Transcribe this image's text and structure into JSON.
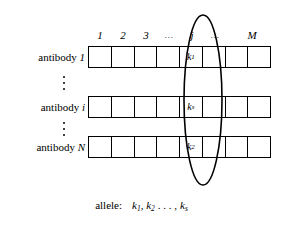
{
  "figure": {
    "name": "antibody-allele-matrix-diagram",
    "background_color": "#ffffff",
    "line_color": "#000000"
  },
  "columns": {
    "headers": [
      {
        "label": "1",
        "kind": "index"
      },
      {
        "label": "2",
        "kind": "index"
      },
      {
        "label": "3",
        "kind": "index"
      },
      {
        "label": "…",
        "kind": "ellipsis"
      },
      {
        "label": "j",
        "kind": "index"
      },
      {
        "label": "…",
        "kind": "ellipsis"
      },
      {
        "label": "M",
        "kind": "index"
      }
    ],
    "highlighted_header": "j",
    "count_label": "M"
  },
  "rows": [
    {
      "label_prefix": "antibody",
      "label_symbol": "1",
      "cells": [
        "",
        "",
        "",
        "",
        "k₁",
        "",
        "",
        ""
      ],
      "highlighted_cell_base": "k",
      "highlighted_cell_sub": "1"
    },
    {
      "label_prefix": "antibody",
      "label_symbol": "i",
      "cells": [
        "",
        "",
        "",
        "",
        "kₛ",
        "",
        "",
        ""
      ],
      "highlighted_cell_base": "k",
      "highlighted_cell_sub": "s"
    },
    {
      "label_prefix": "antibody",
      "label_symbol": "N",
      "cells": [
        "",
        "",
        "",
        "",
        "k₂",
        "",
        "",
        ""
      ],
      "highlighted_cell_base": "k",
      "highlighted_cell_sub": "2"
    }
  ],
  "row_gap_ellipsis": {
    "glyph": "⋮",
    "dot_count": 3
  },
  "caption": {
    "label": "allele:",
    "items": [
      {
        "base": "k",
        "sub": "1"
      },
      {
        "base": "k",
        "sub": "2"
      }
    ],
    "ellipsis": ". . . ,",
    "last": {
      "base": "k",
      "sub": "s"
    },
    "full_text": "allele:   k1, k2, . . . , ks"
  },
  "highlight": {
    "shape": "ellipse",
    "target_column": "j",
    "stroke_color": "#000000",
    "stroke_width": 1.6,
    "fill": "none"
  }
}
